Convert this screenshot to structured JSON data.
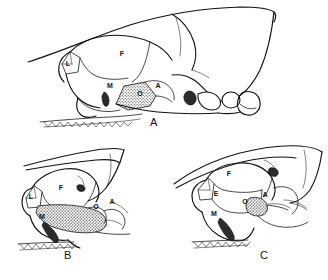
{
  "plate": {
    "background_color": "#ffffff",
    "ink_color": "#111111",
    "caption_font_color": "#111111"
  },
  "figures": [
    {
      "id": "figure-a",
      "panel_label": "A",
      "description": "lateral view of rodent skull, large posterior region",
      "bone_labels": [
        {
          "code": "L",
          "x": 68,
          "y": 66
        },
        {
          "code": "F",
          "x": 122,
          "y": 56
        },
        {
          "code": "M",
          "x": 110,
          "y": 88
        },
        {
          "code": "O",
          "x": 140,
          "y": 96
        },
        {
          "code": "A",
          "x": 158,
          "y": 88
        }
      ]
    },
    {
      "id": "figure-b",
      "panel_label": "B",
      "description": "lateral view of rodent skull with enlarged stippled maxilla",
      "bone_labels": [
        {
          "code": "L",
          "x": 31,
          "y": 199
        },
        {
          "code": "F",
          "x": 61,
          "y": 190
        },
        {
          "code": "M",
          "x": 42,
          "y": 219
        },
        {
          "code": "O",
          "x": 86,
          "y": 209
        },
        {
          "code": "A",
          "x": 98,
          "y": 204
        }
      ]
    },
    {
      "id": "figure-c",
      "panel_label": "C",
      "description": "lateral view of rodent skull with separate E element",
      "bone_labels": [
        {
          "code": "F",
          "x": 229,
          "y": 173
        },
        {
          "code": "E",
          "x": 216,
          "y": 193
        },
        {
          "code": "O",
          "x": 245,
          "y": 201
        },
        {
          "code": "A",
          "x": 265,
          "y": 194
        },
        {
          "code": "M",
          "x": 214,
          "y": 213
        }
      ]
    }
  ],
  "panel_labels": [
    {
      "text": "A",
      "x": 154,
      "y": 122
    },
    {
      "text": "B",
      "x": 68,
      "y": 255
    },
    {
      "text": "C",
      "x": 264,
      "y": 255
    }
  ]
}
